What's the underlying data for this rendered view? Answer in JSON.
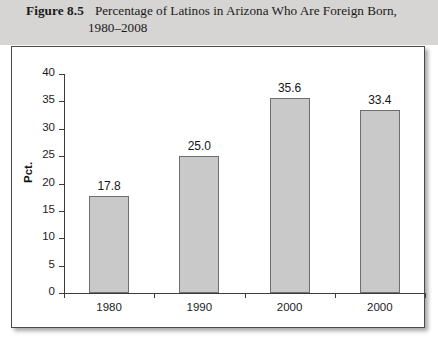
{
  "caption": {
    "label": "Figure 8.5",
    "line1": "Percentage of Latinos in Arizona Who Are Foreign Born,",
    "line2": "1980–2008"
  },
  "chart_data": {
    "type": "bar",
    "title": "Percentage of Latinos in Arizona Who Are Foreign Born, 1980–2008",
    "categories": [
      "1980",
      "1990",
      "2000",
      "2000"
    ],
    "values": [
      17.8,
      25.0,
      35.6,
      33.4
    ],
    "value_labels": [
      "17.8",
      "25.0",
      "35.6",
      "33.4"
    ],
    "xlabel": "",
    "ylabel": "Pct.",
    "ylim": [
      0,
      40
    ],
    "yticks": [
      0,
      5,
      10,
      15,
      20,
      25,
      30,
      35,
      40
    ],
    "ytick_labels": [
      "0",
      "5",
      "10",
      "15",
      "20",
      "25",
      "30",
      "35",
      "40"
    ],
    "grid": false,
    "legend": false,
    "bar_color": "#c9c9c9",
    "bar_border_color": "#6e6e6e",
    "band_color": "#d6d5d3"
  }
}
